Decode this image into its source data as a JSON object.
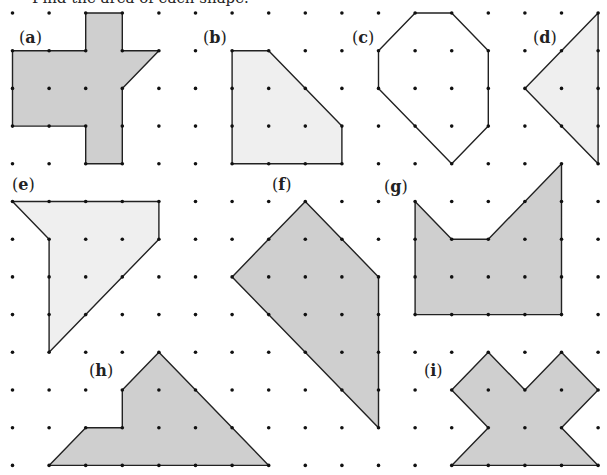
{
  "instruction": "Find the area of each shape.",
  "colors": {
    "dark_fill": "#cfcfcf",
    "light_fill": "#efefef",
    "stroke": "#222222",
    "dot": "#111111"
  },
  "grid": {
    "cols": 17,
    "rows": 13
  },
  "shapes": [
    {
      "id": "a",
      "label": "a",
      "fill": "dark",
      "vertices": [
        [
          2,
          0
        ],
        [
          3,
          0
        ],
        [
          3,
          1
        ],
        [
          4,
          1
        ],
        [
          3,
          2
        ],
        [
          3,
          4
        ],
        [
          2,
          4
        ],
        [
          2,
          3
        ],
        [
          0,
          3
        ],
        [
          0,
          1
        ],
        [
          2,
          1
        ]
      ]
    },
    {
      "id": "b",
      "label": "b",
      "fill": "light",
      "vertices": [
        [
          6,
          1
        ],
        [
          7,
          1
        ],
        [
          9,
          3
        ],
        [
          9,
          4
        ],
        [
          6,
          4
        ]
      ]
    },
    {
      "id": "c",
      "label": "c",
      "fill": "none",
      "vertices": [
        [
          11,
          0
        ],
        [
          12,
          0
        ],
        [
          13,
          1
        ],
        [
          13,
          3
        ],
        [
          12,
          4
        ],
        [
          10,
          2
        ],
        [
          10,
          1
        ]
      ]
    },
    {
      "id": "d",
      "label": "d",
      "fill": "light",
      "vertices": [
        [
          16,
          0
        ],
        [
          16,
          4
        ],
        [
          14,
          2
        ]
      ]
    },
    {
      "id": "e",
      "label": "e",
      "fill": "light",
      "vertices": [
        [
          0,
          5
        ],
        [
          4,
          5
        ],
        [
          4,
          6
        ],
        [
          1,
          9
        ],
        [
          1,
          6
        ]
      ]
    },
    {
      "id": "f",
      "label": "f",
      "fill": "dark",
      "vertices": [
        [
          8,
          5
        ],
        [
          10,
          7
        ],
        [
          10,
          11
        ],
        [
          6,
          7
        ]
      ]
    },
    {
      "id": "g",
      "label": "g",
      "fill": "dark",
      "vertices": [
        [
          11,
          5
        ],
        [
          12,
          6
        ],
        [
          13,
          6
        ],
        [
          15,
          4
        ],
        [
          15,
          8
        ],
        [
          11,
          8
        ]
      ]
    },
    {
      "id": "h",
      "label": "h",
      "fill": "dark",
      "vertices": [
        [
          4,
          9
        ],
        [
          7,
          12
        ],
        [
          1,
          12
        ],
        [
          2,
          11
        ],
        [
          3,
          11
        ],
        [
          3,
          10
        ]
      ]
    },
    {
      "id": "i",
      "label": "i",
      "fill": "dark",
      "vertices": [
        [
          13,
          9
        ],
        [
          14,
          10
        ],
        [
          15,
          9
        ],
        [
          16,
          10
        ],
        [
          15,
          11
        ],
        [
          16,
          12
        ],
        [
          12,
          12
        ],
        [
          13,
          11
        ],
        [
          12,
          10
        ]
      ]
    }
  ]
}
